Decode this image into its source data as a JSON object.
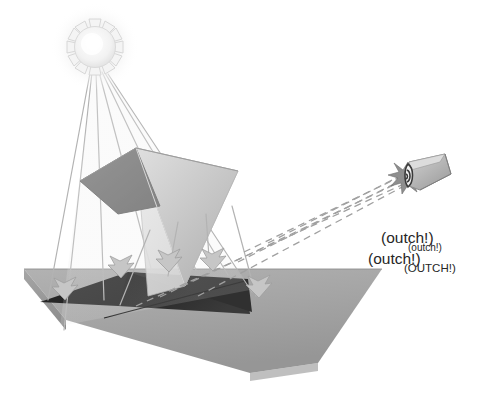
{
  "figure": {
    "background_color": "#ffffff"
  },
  "palette": {
    "ground_top": "#a8a8a8",
    "ground_front": "#9a9a9a",
    "ground_edge": "#7d7d7d",
    "shadow_dark": "#2b2b2b",
    "mirror_dark": "#8d8d8d",
    "mirror_light": "#c9c9c9",
    "ray_line": "#b3b3b3",
    "dashed_ray": "#a0a0a0",
    "sun_outline": "#d9d9d9",
    "eye_body": "#b5b5b5",
    "text_color": "#262626"
  },
  "elements": {
    "sun": {
      "name": "sun",
      "cx": 95,
      "cy": 47,
      "radius": 20,
      "ray_count": 12
    },
    "mirror": {
      "name": "mirror-prism",
      "description": "tilted reflective triangular panel"
    },
    "ground": {
      "name": "ground-plane",
      "description": "flat gray surface receiving light"
    },
    "shadow": {
      "name": "cast-shadow",
      "description": "dark shadow of mirror on ground"
    },
    "eye": {
      "name": "observer-eye",
      "x": 422,
      "y": 172,
      "description": "eye cone being struck by reflected light"
    },
    "impact": {
      "name": "impact-starburst",
      "x": 408,
      "y": 176
    }
  },
  "rays": {
    "incident": {
      "name": "incident-sun-rays",
      "style": "solid",
      "count": 6,
      "color": "#b3b3b3"
    },
    "reflected": {
      "name": "reflected-rays",
      "style": "dashed",
      "count": 5,
      "color": "#a0a0a0"
    },
    "arrows": {
      "name": "ray-arrowheads",
      "count": 5
    }
  },
  "labels": {
    "outch_1": "(outch!)",
    "outch_2": "(outch!)",
    "outch_3": "(outch!)",
    "outch_4": "(OUTCH!)"
  }
}
